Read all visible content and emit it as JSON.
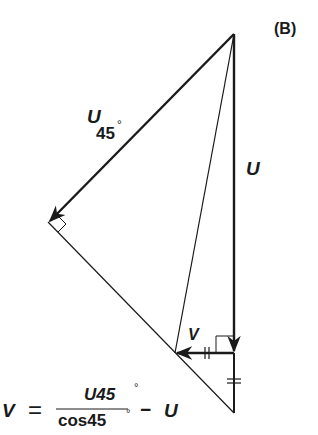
{
  "figure": {
    "panel_label": "(B)",
    "vectors": {
      "u45": {
        "symbol": "U",
        "subscript": "45",
        "degree": "°"
      },
      "u": {
        "symbol": "U"
      },
      "v": {
        "symbol": "V"
      }
    },
    "equation": {
      "lhs": "V",
      "equals": "=",
      "numerator": "U45",
      "numerator_degree": "°",
      "denominator": "cos45",
      "denominator_degree": "°",
      "minus": "−",
      "rhs_term": "U"
    },
    "colors": {
      "ink": "#1a1a1a",
      "background": "#ffffff"
    }
  }
}
